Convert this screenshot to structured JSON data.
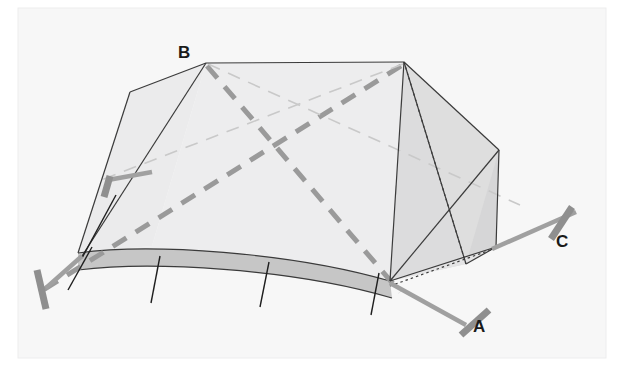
{
  "figure": {
    "kind": "tent-diagram",
    "canvas": {
      "width": 624,
      "height": 372
    },
    "background_color": "#ffffff",
    "paper_color": "#f7f7f7",
    "border_color": "#ececed"
  },
  "colors": {
    "fly_light": "#eeeeef",
    "fly_mid": "#e3e3e4",
    "fly_shade": "#d3d3d4",
    "ground_band": "#c6c6c6",
    "outline": "#3b3b3b",
    "pole_gray": "#9a9a9a",
    "pole_light": "#c9c9c9",
    "guy_gray": "#9e9e9e",
    "stake_gray": "#8f8f8f",
    "label_color": "#1a1a1a"
  },
  "labels": [
    {
      "id": "label-b",
      "text": "B",
      "x": 184,
      "y": 56
    },
    {
      "id": "label-a",
      "text": "A",
      "x": 479,
      "y": 329
    },
    {
      "id": "label-c",
      "text": "C",
      "x": 562,
      "y": 245
    }
  ],
  "geometry": {
    "apex_left": [
      206,
      63
    ],
    "apex_right": [
      404,
      62
    ],
    "ridge": [
      [
        206,
        63
      ],
      [
        404,
        62
      ]
    ],
    "left_corner_top": [
      130,
      92
    ],
    "left_corner_bottom": [
      78,
      253
    ],
    "front_left_base": [
      78,
      253
    ],
    "front_mid_base": [
      226,
      270
    ],
    "front_right_base": [
      390,
      281
    ],
    "right_front_corner": [
      390,
      281
    ],
    "right_outer_corner": [
      496,
      247
    ],
    "right_upper_corner": [
      499,
      150
    ],
    "back_hidden_corner": [
      466,
      264
    ]
  },
  "elements": {
    "ridge_line": "ridge-line",
    "left_panel": "left-end-panel",
    "front_panel": "front-fly-panel",
    "right_panel": "right-end-panel",
    "ground_band": "ground-skirt-band",
    "pole_dashes": "crossing-pole-dashed",
    "hidden_edges": "hidden-edge-dotted"
  },
  "guy_lines": [
    {
      "id": "guy-line-left",
      "from": [
        78,
        253
      ],
      "to": [
        45,
        287
      ]
    },
    {
      "id": "guy-line-a",
      "from": [
        390,
        281
      ],
      "to": [
        466,
        324
      ]
    },
    {
      "id": "guy-line-c",
      "from": [
        496,
        247
      ],
      "to": [
        575,
        213
      ]
    },
    {
      "id": "guy-line-upper-left",
      "from": [
        150,
        170
      ],
      "to": [
        104,
        178
      ]
    }
  ],
  "stakes": [
    {
      "id": "stake-left",
      "from": [
        38,
        271
      ],
      "to": [
        45,
        308
      ]
    },
    {
      "id": "stake-a",
      "from": [
        488,
        311
      ],
      "to": [
        462,
        334
      ]
    },
    {
      "id": "stake-c",
      "from": [
        571,
        208
      ],
      "to": [
        552,
        238
      ]
    },
    {
      "id": "stake-upper-left",
      "from": [
        110,
        177
      ],
      "to": [
        104,
        196
      ]
    }
  ],
  "seam_lines": [
    {
      "id": "seam-1",
      "from": [
        159,
        258
      ],
      "to": [
        151,
        302
      ]
    },
    {
      "id": "seam-2",
      "from": [
        268,
        263
      ],
      "to": [
        260,
        306
      ]
    },
    {
      "id": "seam-3",
      "from": [
        378,
        272
      ],
      "to": [
        372,
        314
      ]
    },
    {
      "id": "seam-0",
      "from": [
        90,
        248
      ],
      "to": [
        68,
        290
      ]
    }
  ]
}
